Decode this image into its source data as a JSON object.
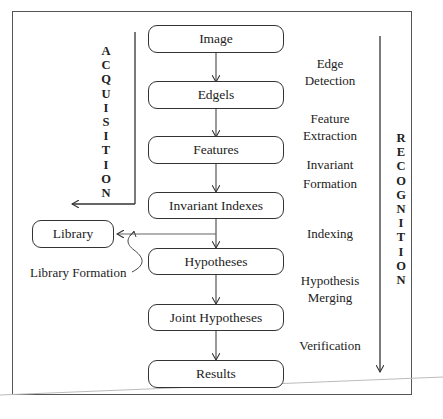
{
  "diagram": {
    "type": "flowchart",
    "nodes": [
      {
        "id": "image",
        "label": "Image"
      },
      {
        "id": "edgels",
        "label": "Edgels"
      },
      {
        "id": "features",
        "label": "Features"
      },
      {
        "id": "invariant_indexes",
        "label": "Invariant Indexes"
      },
      {
        "id": "hypotheses",
        "label": "Hypotheses"
      },
      {
        "id": "joint_hypotheses",
        "label": "Joint Hypotheses"
      },
      {
        "id": "results",
        "label": "Results"
      },
      {
        "id": "library",
        "label": "Library"
      }
    ],
    "steps": [
      {
        "line1": "Edge",
        "line2": "Detection"
      },
      {
        "line1": "Feature",
        "line2": "Extraction"
      },
      {
        "line1": "Invariant",
        "line2": "Formation"
      },
      {
        "line1": "Indexing",
        "line2": ""
      },
      {
        "line1": "Hypothesis",
        "line2": "Merging"
      },
      {
        "line1": "Verification",
        "line2": ""
      }
    ],
    "library_formation_label": "Library Formation",
    "acquisition_label": [
      "A",
      "C",
      "Q",
      "U",
      "I",
      "S",
      "I",
      "T",
      "I",
      "O",
      "N"
    ],
    "recognition_label": [
      "R",
      "E",
      "C",
      "O",
      "G",
      "N",
      "I",
      "T",
      "I",
      "O",
      "N"
    ],
    "edges": [
      {
        "from": "image",
        "to": "edgels"
      },
      {
        "from": "edgels",
        "to": "features"
      },
      {
        "from": "features",
        "to": "invariant_indexes"
      },
      {
        "from": "invariant_indexes",
        "to": "hypotheses"
      },
      {
        "from": "invariant_indexes",
        "to": "library"
      },
      {
        "from": "hypotheses",
        "to": "joint_hypotheses"
      },
      {
        "from": "joint_hypotheses",
        "to": "results"
      }
    ]
  }
}
